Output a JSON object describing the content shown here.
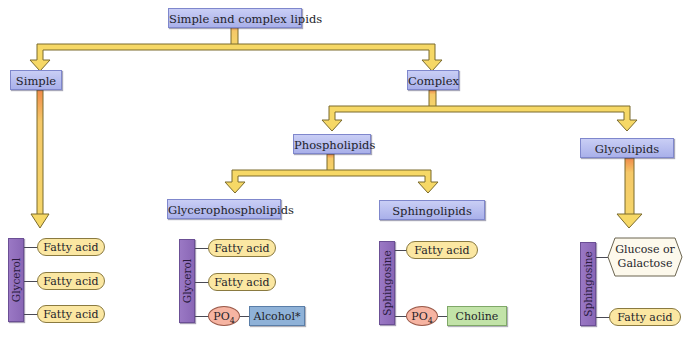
{
  "diagram": {
    "root": "Simple and complex lipids",
    "level1": {
      "simple": "Simple",
      "complex": "Complex"
    },
    "level2": {
      "phospholipids": "Phospholipids",
      "glycolipids": "Glycolipids"
    },
    "level3": {
      "glycerophospholipids": "Glycerophospholipids",
      "sphingolipids": "Sphingolipids"
    },
    "structures": {
      "triacylglycerol": {
        "backbone": "Glycerol",
        "groups": [
          "Fatty acid",
          "Fatty acid",
          "Fatty acid"
        ]
      },
      "glycerophospholipid": {
        "backbone": "Glycerol",
        "groups": [
          "Fatty acid",
          "Fatty acid"
        ],
        "phosphate": "PO",
        "phosphate_sub": "4",
        "head": "Alcohol*"
      },
      "sphingophospholipid": {
        "backbone": "Sphingosine",
        "groups": [
          "Fatty acid"
        ],
        "phosphate": "PO",
        "phosphate_sub": "4",
        "head": "Choline"
      },
      "glycolipid": {
        "backbone": "Sphingosine",
        "sugar_line1": "Glucose or",
        "sugar_line2": "Galactose",
        "groups": [
          "Fatty acid"
        ]
      }
    },
    "colors": {
      "node_fill": "#b7bdef",
      "arrow_fill": "#f5d66a",
      "arrow_stem_top": "#f08a4a",
      "backbone": "#9272bd",
      "fatty_acid": "#fbe7a2",
      "phosphate": "#f6b4a2",
      "alcohol": "#8fb2d8",
      "choline": "#c2e3a8"
    }
  }
}
